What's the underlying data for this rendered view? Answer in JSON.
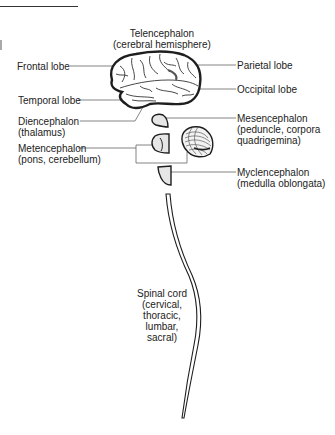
{
  "diagram": {
    "type": "anatomy-labeled-illustration",
    "colors": {
      "ink": "#1e1e1e",
      "leader_line": "#666666",
      "fill_light": "#e6e6e6",
      "background": "#ffffff"
    },
    "labels": {
      "telencephalon": {
        "title": "Telencephalon",
        "sub": "(cerebral hemisphere)"
      },
      "frontal_lobe": "Frontal lobe",
      "parietal_lobe": "Parietal lobe",
      "occipital_lobe": "Occipital lobe",
      "temporal_lobe": "Temporal lobe",
      "diencephalon": {
        "title": "Diencephalon",
        "sub": "(thalamus)"
      },
      "mesencephalon": {
        "title": "Mesencephalon",
        "sub1": "(peduncle, corpora",
        "sub2": "quadrigemina)"
      },
      "metencephalon": {
        "title": "Metencephalon",
        "sub": "(pons, cerebellum)"
      },
      "myelencephalon": {
        "title": "Myclencephalon",
        "sub": "(medulla oblongata)"
      },
      "spinal_cord": {
        "title": "Spinal cord",
        "l1": "(cervical,",
        "l2": "thoracic,",
        "l3": "lumbar,",
        "l4": "sacral)"
      }
    }
  }
}
